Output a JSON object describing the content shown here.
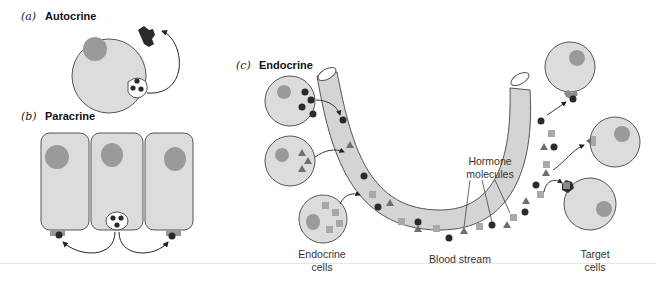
{
  "panels": {
    "a": {
      "letter": "(a)",
      "title": "Autocrine"
    },
    "b": {
      "letter": "(b)",
      "title": "Paracrine"
    },
    "c": {
      "letter": "(c)",
      "title": "Endocrine"
    }
  },
  "labels": {
    "hormone_molecules": [
      "Hormone",
      "molecules"
    ],
    "endocrine_cells": [
      "Endocrine",
      "cells"
    ],
    "blood_stream": "Blood stream",
    "target_cells": [
      "Target",
      "cells"
    ]
  },
  "colors": {
    "cell_fill": "#dcdcdc",
    "cell_stroke": "#555555",
    "nucleus": "#9a9a9a",
    "hormone_circle": "#2a2a2a",
    "hormone_triangle": "#6e6e6e",
    "hormone_square": "#a8a8a8",
    "vessel_fill": "#d4d4d4",
    "arrow": "#222222"
  }
}
